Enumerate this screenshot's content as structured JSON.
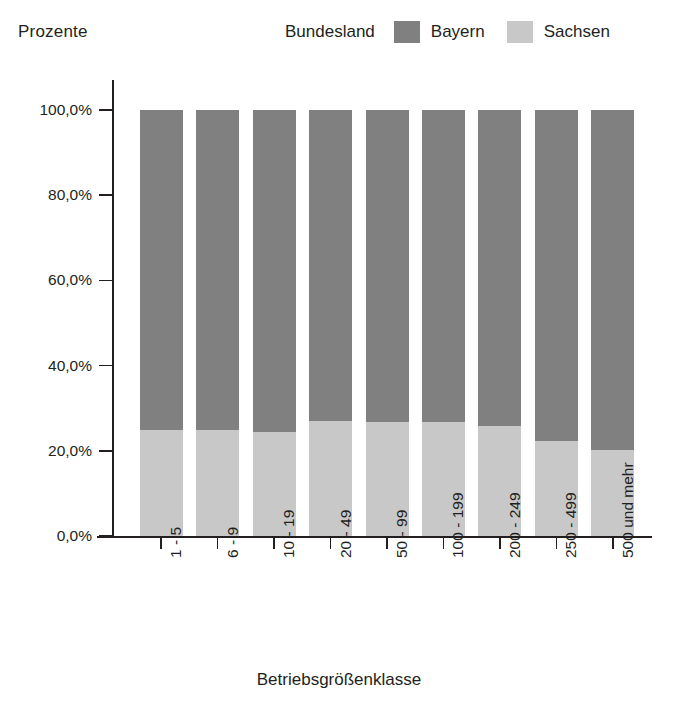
{
  "axis": {
    "y_title": "Prozente",
    "x_title": "Betriebsgrößenklasse",
    "y_ticks": [
      "100,0%",
      "80,0%",
      "60,0%",
      "40,0%",
      "20,0%",
      "0,0%"
    ]
  },
  "legend": {
    "title": "Bundesland",
    "entries": [
      {
        "label": "Bayern",
        "color": "#808080"
      },
      {
        "label": "Sachsen",
        "color": "#c8c8c8"
      }
    ]
  },
  "chart_data": {
    "type": "bar",
    "subtype": "stacked-100-percent",
    "title": "",
    "xlabel": "Betriebsgrößenklasse",
    "ylabel": "Prozente",
    "ylim": [
      0,
      100
    ],
    "ytick_values": [
      100,
      80,
      60,
      40,
      20,
      0
    ],
    "ytick_labels": [
      "100,0%",
      "80,0%",
      "60,0%",
      "40,0%",
      "20,0%",
      "0,0%"
    ],
    "grid": false,
    "legend_position": "top-right",
    "legend_title": "Bundesland",
    "categories": [
      "1 - 5",
      "6 - 9",
      "10 - 19",
      "20 - 49",
      "50 - 99",
      "100 - 199",
      "200 - 249",
      "250 - 499",
      "500 und mehr"
    ],
    "series": [
      {
        "name": "Bayern",
        "color": "#808080",
        "values": [
          75.0,
          75.2,
          75.5,
          73.0,
          73.2,
          73.2,
          74.2,
          77.7,
          79.8
        ]
      },
      {
        "name": "Sachsen",
        "color": "#c8c8c8",
        "values": [
          25.0,
          24.8,
          24.5,
          27.0,
          26.8,
          26.8,
          25.8,
          22.3,
          20.2
        ]
      }
    ]
  }
}
